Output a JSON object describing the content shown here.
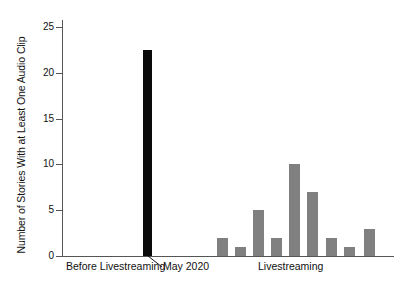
{
  "chart_data": {
    "type": "bar",
    "title": "",
    "subtitle": "",
    "xlabel": "",
    "ylabel": "Number of Stories With at Least One Audio Clip",
    "ylim": [
      0,
      26
    ],
    "ytick_labels": [
      "0",
      "5",
      "10",
      "15",
      "20",
      "25"
    ],
    "ytick_values": [
      0,
      5,
      10,
      15,
      20,
      25
    ],
    "grid": false,
    "legend": "none",
    "x_group_labels": [
      "Before Livestreaming",
      "May 2020",
      "Livestreaming"
    ],
    "series": [
      {
        "name": "Before Livestreaming",
        "color": "#808080",
        "values": []
      },
      {
        "name": "May 2020",
        "color": "#0a0a0a",
        "values": [
          22.5
        ]
      },
      {
        "name": "Livestreaming",
        "color": "#808080",
        "values": [
          2,
          1,
          5,
          2,
          10,
          7,
          2,
          1,
          3
        ]
      }
    ],
    "bars": [
      {
        "group": "May 2020",
        "value": 22.5,
        "color": "#0a0a0a",
        "x": 81,
        "width": 9
      },
      {
        "group": "Livestreaming",
        "value": 2,
        "color": "#808080",
        "x": 155,
        "width": 11
      },
      {
        "group": "Livestreaming",
        "value": 1,
        "color": "#808080",
        "x": 173,
        "width": 11
      },
      {
        "group": "Livestreaming",
        "value": 5,
        "color": "#808080",
        "x": 191,
        "width": 11
      },
      {
        "group": "Livestreaming",
        "value": 2,
        "color": "#808080",
        "x": 209,
        "width": 11
      },
      {
        "group": "Livestreaming",
        "value": 10,
        "color": "#808080",
        "x": 227,
        "width": 11
      },
      {
        "group": "Livestreaming",
        "value": 7,
        "color": "#808080",
        "x": 245,
        "width": 11
      },
      {
        "group": "Livestreaming",
        "value": 2,
        "color": "#808080",
        "x": 264,
        "width": 11
      },
      {
        "group": "Livestreaming",
        "value": 1,
        "color": "#808080",
        "x": 282,
        "width": 11
      },
      {
        "group": "Livestreaming",
        "value": 3,
        "color": "#808080",
        "x": 302,
        "width": 11
      }
    ]
  },
  "axis": {
    "y_title": "Number of Stories With at Least One Audio Clip",
    "ticks": [
      {
        "label": "25",
        "value": 25
      },
      {
        "label": "20",
        "value": 20
      },
      {
        "label": "15",
        "value": 15
      },
      {
        "label": "10",
        "value": 10
      },
      {
        "label": "5",
        "value": 5
      },
      {
        "label": "0",
        "value": 0
      }
    ]
  },
  "x_labels": [
    {
      "text": "Before Livestreaming",
      "left": 66
    },
    {
      "text": "May 2020",
      "left": 163
    },
    {
      "text": "Livestreaming",
      "left": 258
    }
  ],
  "colors": {
    "bar_gray": "#808080",
    "bar_black": "#0a0a0a",
    "axis": "#555555",
    "text": "#111111",
    "background": "#ffffff"
  }
}
